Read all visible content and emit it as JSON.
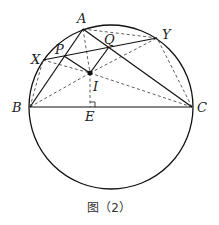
{
  "figure": {
    "caption": "图（2）",
    "circle": {
      "cx": 111,
      "cy": 107,
      "r": 82
    },
    "points": {
      "A": {
        "label": "A",
        "x": 83,
        "y": 29
      },
      "B": {
        "label": "B",
        "x": 30,
        "y": 107
      },
      "C": {
        "label": "C",
        "x": 192,
        "y": 107
      },
      "X": {
        "label": "X",
        "x": 43,
        "y": 60
      },
      "Y": {
        "label": "Y",
        "x": 157,
        "y": 38
      },
      "P": {
        "label": "P",
        "x": 64,
        "y": 56
      },
      "Q": {
        "label": "Q",
        "x": 109,
        "y": 47
      },
      "I": {
        "label": "I",
        "x": 90,
        "y": 73
      },
      "E": {
        "label": "E",
        "x": 90,
        "y": 107
      }
    },
    "solid_segments": [
      "AB",
      "BC",
      "CA",
      "XY",
      "PI",
      "QI"
    ],
    "dashed_segments": [
      "AI",
      "IE",
      "AY",
      "BX",
      "CY",
      "BI",
      "CI",
      "XI",
      "YI",
      "BQ",
      "CP"
    ],
    "right_angle_at": "E",
    "stroke_color": "#111111"
  }
}
